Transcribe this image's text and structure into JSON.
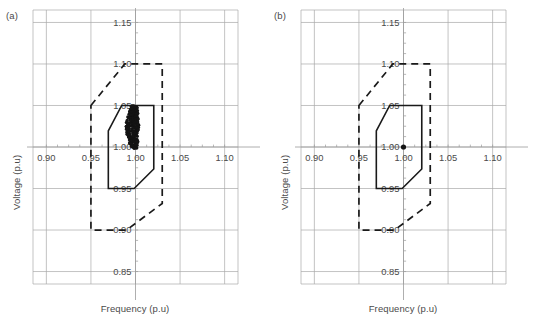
{
  "figure": {
    "panels": [
      {
        "id": "panel-a",
        "label": "(a)",
        "xlabel": "Frequency (p.u)",
        "ylabel": "Voltage (p.u)"
      },
      {
        "id": "panel-b",
        "label": "(b)",
        "xlabel": "Frequency (p.u)",
        "ylabel": "Voltage (p.u)"
      }
    ]
  },
  "chart_data": [
    {
      "type": "scatter",
      "panel": "(a)",
      "title": "",
      "xlabel": "Frequency (p.u)",
      "ylabel": "Voltage (p.u)",
      "xlim": [
        0.885,
        1.115
      ],
      "ylim": [
        0.835,
        1.165
      ],
      "xticks": [
        0.9,
        0.95,
        1.0,
        1.05,
        1.1
      ],
      "xticklabels": [
        "0.90",
        "0.95",
        "1.00",
        "1.05",
        "1.10"
      ],
      "yticks": [
        0.85,
        0.9,
        0.95,
        1.0,
        1.05,
        1.1,
        1.15
      ],
      "yticklabels": [
        "0.85",
        "0.90",
        "0.95",
        "1.00",
        "1.05",
        "1.10",
        "1.15"
      ],
      "grid": true,
      "legend": "none",
      "series": [
        {
          "name": "outer operating envelope",
          "style": "dashed-polygon",
          "points": [
            [
              0.95,
              1.05
            ],
            [
              0.988,
              1.1
            ],
            [
              1.03,
              1.1
            ],
            [
              1.03,
              0.932
            ],
            [
              0.99,
              0.9
            ],
            [
              0.95,
              0.9
            ]
          ]
        },
        {
          "name": "inner operating envelope",
          "style": "solid-polygon",
          "points": [
            [
              0.9695,
              1.0195
            ],
            [
              0.9845,
              1.05
            ],
            [
              1.0205,
              1.05
            ],
            [
              1.0205,
              0.9735
            ],
            [
              0.9985,
              0.95
            ],
            [
              0.9695,
              0.95
            ]
          ]
        },
        {
          "name": "operating points",
          "style": "scatter-cluster",
          "x_center": 1.0,
          "y_min": 0.9985,
          "y_max": 1.0495,
          "x_spread": 0.0035,
          "n_points": 220
        }
      ]
    },
    {
      "type": "scatter",
      "panel": "(b)",
      "title": "",
      "xlabel": "Frequency (p.u)",
      "ylabel": "Voltage (p.u)",
      "xlim": [
        0.885,
        1.115
      ],
      "ylim": [
        0.835,
        1.165
      ],
      "xticks": [
        0.9,
        0.95,
        1.0,
        1.05,
        1.1
      ],
      "xticklabels": [
        "0.90",
        "0.95",
        "1.00",
        "1.05",
        "1.10"
      ],
      "yticks": [
        0.85,
        0.9,
        0.95,
        1.0,
        1.05,
        1.1,
        1.15
      ],
      "yticklabels": [
        "0.85",
        "0.90",
        "0.95",
        "1.00",
        "1.05",
        "1.10",
        "1.15"
      ],
      "grid": true,
      "legend": "none",
      "series": [
        {
          "name": "outer operating envelope",
          "style": "dashed-polygon",
          "points": [
            [
              0.95,
              1.05
            ],
            [
              0.988,
              1.1
            ],
            [
              1.03,
              1.1
            ],
            [
              1.03,
              0.932
            ],
            [
              0.99,
              0.9
            ],
            [
              0.95,
              0.9
            ]
          ]
        },
        {
          "name": "inner operating envelope",
          "style": "solid-polygon",
          "points": [
            [
              0.9695,
              1.0195
            ],
            [
              0.9845,
              1.05
            ],
            [
              1.0205,
              1.05
            ],
            [
              1.0205,
              0.9735
            ],
            [
              0.9985,
              0.95
            ],
            [
              0.9695,
              0.95
            ]
          ]
        },
        {
          "name": "operating points",
          "style": "scatter-point",
          "x_center": 1.0,
          "y_center": 1.0,
          "n_points": 1
        }
      ]
    }
  ],
  "colors": {
    "grid": "#a9a9a9",
    "axis": "#9b9b9b",
    "envelope": "#1a1a1a",
    "point": "#141414",
    "text": "#4a4a4a",
    "background": "#ffffff"
  }
}
